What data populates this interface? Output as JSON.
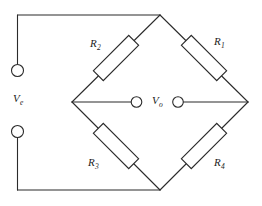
{
  "figure": {
    "name": "wheatstone-bridge-circuit",
    "stroke_color": "#2b2b2b",
    "background_color": "#ffffff"
  },
  "labels": {
    "r1": {
      "symbol": "R",
      "subscript": "1"
    },
    "r2": {
      "symbol": "R",
      "subscript": "2"
    },
    "r3": {
      "symbol": "R",
      "subscript": "3"
    },
    "r4": {
      "symbol": "R",
      "subscript": "4"
    },
    "ve": {
      "symbol": "V",
      "subscript": "e"
    },
    "vo": {
      "symbol": "V",
      "subscript": "o"
    }
  },
  "nodes": {
    "top": "bridge-node-top",
    "left": "bridge-node-left",
    "right": "bridge-node-right",
    "bottom": "bridge-node-bottom"
  },
  "terminals": {
    "excitation_positive": "excitation-terminal-top",
    "excitation_negative": "excitation-terminal-bottom",
    "output_left": "output-terminal-left",
    "output_right": "output-terminal-right"
  }
}
